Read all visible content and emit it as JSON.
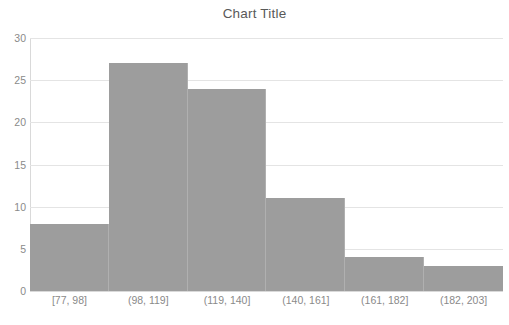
{
  "chart_data": {
    "type": "bar",
    "title": "Chart Title",
    "subtitle": "",
    "xlabel": "",
    "ylabel": "",
    "categories": [
      "[77, 98]",
      "(98, 119]",
      "(119, 140]",
      "(140, 161]",
      "(161, 182]",
      "(182, 203]"
    ],
    "values": [
      8,
      27,
      24,
      11,
      4,
      3
    ],
    "ylim": [
      0,
      30
    ],
    "yticks": [
      0,
      5,
      10,
      15,
      20,
      25,
      30
    ],
    "ytick_labels": [
      "0",
      "5",
      "10",
      "15",
      "20",
      "25",
      "30"
    ],
    "grid": true,
    "legend": false,
    "legend_position": "none",
    "bar_color": "#9d9d9d",
    "gridline_color": "#e4e4e4",
    "text_color": "#8a8a8a",
    "title_color": "#595959",
    "background": "#ffffff",
    "histogram": true,
    "bar_gap": 0
  }
}
